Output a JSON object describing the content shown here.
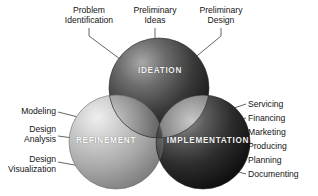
{
  "diagram": {
    "circles": [
      {
        "key": "ideation",
        "label": "IDEATION",
        "fill": "#4a4a4a",
        "highlight": "#9a9a9a",
        "shadow": "#171717"
      },
      {
        "key": "refinement",
        "label": "REFINEMENT",
        "fill": "#b3b3b3",
        "highlight": "#e6e6e6",
        "shadow": "#7d7d7d"
      },
      {
        "key": "implementation",
        "label": "IMPLEMENTATION",
        "fill": "#3c3c3c",
        "highlight": "#8a8a8a",
        "shadow": "#101010"
      }
    ],
    "top_callouts": [
      {
        "key": "problem-identification",
        "text": "Problem\nIdentification"
      },
      {
        "key": "preliminary-ideas",
        "text": "Preliminary\nIdeas"
      },
      {
        "key": "preliminary-design",
        "text": "Preliminary\nDesign"
      }
    ],
    "left_callouts": [
      {
        "key": "modeling",
        "text": "Modeling"
      },
      {
        "key": "design-analysis",
        "text": "Design\nAnalysis"
      },
      {
        "key": "design-visualization",
        "text": "Design\nVisualization"
      }
    ],
    "right_callouts": [
      {
        "key": "servicing",
        "text": "Servicing"
      },
      {
        "key": "financing",
        "text": "Financing"
      },
      {
        "key": "marketing",
        "text": "Marketing"
      },
      {
        "key": "producing",
        "text": "Producing"
      },
      {
        "key": "planning",
        "text": "Planning"
      },
      {
        "key": "documenting",
        "text": "Documenting"
      }
    ],
    "colors": {
      "background": "#ffffff",
      "leader_line": "#3d3d3d",
      "caption_text": "#f2f2f2",
      "callout_text": "#141414"
    }
  }
}
